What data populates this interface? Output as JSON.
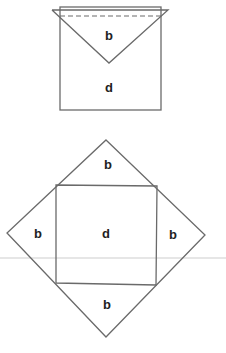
{
  "colors": {
    "stroke": "#6a6a6a",
    "text": "#222222",
    "divider": "#e4e4e4"
  },
  "top_figure": {
    "flap_label": "b",
    "body_label": "d"
  },
  "bottom_figure": {
    "top_flap_label": "b",
    "left_flap_label": "b",
    "center_label": "d",
    "right_flap_label": "b",
    "bottom_flap_label": "b"
  }
}
